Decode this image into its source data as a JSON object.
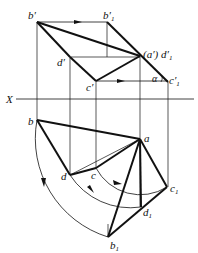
{
  "diagram": {
    "type": "descriptive-geometry-rotation",
    "axis_label": "X",
    "front_view": {
      "labels": {
        "b_prime": "b′",
        "b1_prime": "b′",
        "b1_prime_sub": "1",
        "a_prime_d1_prime": "(a′) d′",
        "a_prime_d1_prime_sub": "1",
        "d_prime": "d′",
        "c_prime": "c′",
        "c1_prime": "c′",
        "c1_prime_sub": "1",
        "alpha": "α"
      }
    },
    "top_view": {
      "labels": {
        "b": "b",
        "a": "a",
        "d": "d",
        "c": "c",
        "c1": "c",
        "c1_sub": "1",
        "d1": "d",
        "d1_sub": "1",
        "b1": "b",
        "b1_sub": "1"
      }
    },
    "colors": {
      "line": "#111111",
      "background": "#ffffff"
    }
  }
}
